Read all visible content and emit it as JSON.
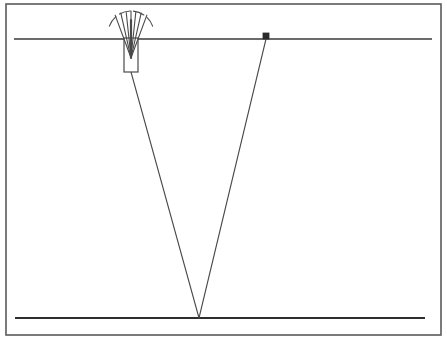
{
  "figure": {
    "type": "technical-line-diagram",
    "title": "",
    "width": 447,
    "height": 341,
    "background_color": "#ffffff",
    "stroke_color": "#3a3a3a",
    "frame": {
      "label": "outer-border-frame",
      "x": 6,
      "y": 4,
      "width": 435,
      "height": 331,
      "stroke_width": 1.6,
      "color": "#5a5a5a"
    },
    "surface_line": {
      "label": "upper-horizontal-line",
      "x1": 14,
      "y1": 39,
      "x2": 432,
      "y2": 39,
      "stroke_width": 1.5,
      "color": "#3a3a3a"
    },
    "base_line": {
      "label": "lower-horizontal-line",
      "x1": 15,
      "y1": 318,
      "x2": 425,
      "y2": 318,
      "stroke_width": 1.8,
      "color": "#2e2e2e"
    },
    "source_device": {
      "label": "spray-nozzle-device",
      "body_x": 124,
      "body_y": 38,
      "body_width": 14,
      "body_height": 34,
      "stroke_width": 1.2,
      "color": "#4a4a4a",
      "fill": "#ffffff",
      "emitter_x": 131,
      "emitter_y": 37,
      "fan_rays": [
        {
          "angle_deg": -126,
          "length": 27
        },
        {
          "angle_deg": -113,
          "length": 26
        },
        {
          "angle_deg": -101,
          "length": 25
        },
        {
          "angle_deg": -90,
          "length": 26
        },
        {
          "angle_deg": -79,
          "length": 25
        },
        {
          "angle_deg": -67,
          "length": 26
        },
        {
          "angle_deg": -54,
          "length": 27
        }
      ],
      "inner_shaft": {
        "x1": 131,
        "y1": 20,
        "x2": 131,
        "y2": 58,
        "stroke_width": 2.2
      },
      "arc_dashes": [
        {
          "cx": 131,
          "cy": 34,
          "r": 23,
          "start_deg": -160,
          "end_deg": -131
        },
        {
          "cx": 131,
          "cy": 34,
          "r": 23,
          "start_deg": -120,
          "end_deg": -92
        },
        {
          "cx": 131,
          "cy": 34,
          "r": 23,
          "start_deg": -84,
          "end_deg": -56
        },
        {
          "cx": 131,
          "cy": 34,
          "r": 23,
          "start_deg": -46,
          "end_deg": -20
        }
      ]
    },
    "receiver_marker": {
      "label": "receiver-square-marker",
      "x": 263,
      "y": 33,
      "size": 6,
      "fill": "#2b2b2b",
      "stroke_width": 0.8
    },
    "ray_paths": [
      {
        "label": "left-ray-path",
        "x1": 131,
        "y1": 72,
        "x2": 199,
        "y2": 318,
        "stroke_width": 1.1,
        "color": "#4a4a4a"
      },
      {
        "label": "right-ray-path",
        "x1": 266,
        "y1": 39,
        "x2": 199,
        "y2": 318,
        "stroke_width": 1.1,
        "color": "#4a4a4a"
      }
    ],
    "vertex": {
      "label": "ray-convergence-vertex",
      "x": 199,
      "y": 318
    }
  }
}
